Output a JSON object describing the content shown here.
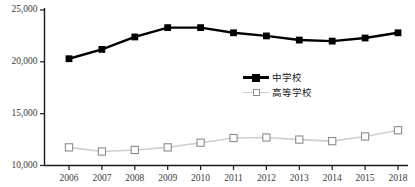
{
  "chart_data": {
    "type": "line",
    "title": "",
    "subtitle": "",
    "xlabel": "",
    "ylabel": "",
    "categories": [
      "2006",
      "2007",
      "2008",
      "2009",
      "2010",
      "2011",
      "2012",
      "2013",
      "2014",
      "2015",
      "2018"
    ],
    "series": [
      {
        "name": "中学校",
        "color": "#000000",
        "marker": "filled-square",
        "values": [
          20300,
          21200,
          22400,
          23300,
          23300,
          22800,
          22500,
          22100,
          22000,
          22300,
          22800
        ]
      },
      {
        "name": "高等学校",
        "color": "#cfcfcf",
        "marker": "open-square",
        "values": [
          11750,
          11350,
          11500,
          11750,
          12200,
          12650,
          12700,
          12500,
          12350,
          12800,
          13400
        ]
      }
    ],
    "ylim": [
      10000,
      25000
    ],
    "ytick_values": [
      10000,
      15000,
      20000,
      25000
    ],
    "ytick_labels": [
      "10,000",
      "15,000",
      "20,000",
      "25,000"
    ],
    "grid": false,
    "legend_position": "center-right",
    "axis_color": "#1a1a1a",
    "tick_label_color": "#3b3b3b"
  }
}
